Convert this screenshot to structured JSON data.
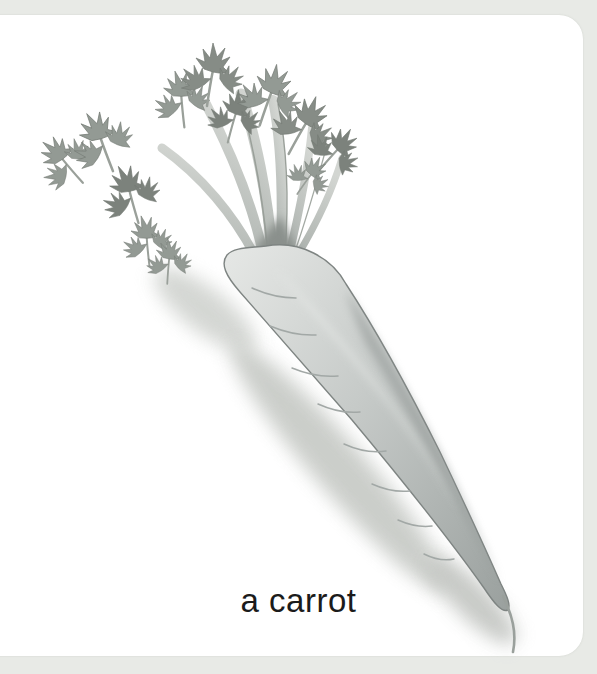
{
  "card": {
    "caption": "a carrot",
    "illustration_alt": "grayscale-pencil-drawing-of-a-carrot-with-leafy-tops"
  },
  "colors": {
    "page_background": "#e8eae6",
    "card_background": "#ffffff",
    "caption_text": "#1b1b1b",
    "carrot_body_light": "#e6e8e6",
    "carrot_body_mid": "#c3c7c5",
    "carrot_body_dark": "#979d9b",
    "carrot_outline": "#7e8482",
    "foliage_mid": "#939a94",
    "foliage_dark": "#6e746e",
    "stem_light": "#c9cdc9",
    "stem_edge": "#9aa09a",
    "shadow_soft": "#c6c9c5"
  }
}
